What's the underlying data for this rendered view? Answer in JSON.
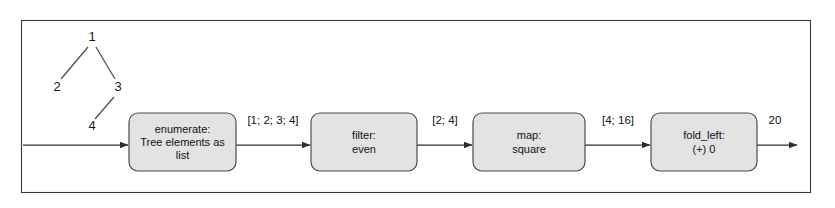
{
  "diagram": {
    "frame": {
      "border_color": "#3a3a3a",
      "background": "#ffffff"
    },
    "box_style": {
      "fill": "#e3e3e3",
      "stroke": "#4d4d4d"
    },
    "tree": {
      "nodes": [
        {
          "id": "n1",
          "label": "1",
          "x": 92,
          "y": 38
        },
        {
          "id": "n2",
          "label": "2",
          "x": 57,
          "y": 88
        },
        {
          "id": "n3",
          "label": "3",
          "x": 118,
          "y": 88
        },
        {
          "id": "n4",
          "label": "4",
          "x": 92,
          "y": 127
        }
      ],
      "edges": [
        {
          "from": "n1",
          "to": "n2"
        },
        {
          "from": "n1",
          "to": "n3"
        },
        {
          "from": "n3",
          "to": "n4"
        }
      ]
    },
    "stages": [
      {
        "id": "enumerate",
        "lines": [
          "enumerate:",
          "Tree elements as",
          "list"
        ],
        "x": 129,
        "y": 113,
        "width": 107,
        "height": 58
      },
      {
        "id": "filter",
        "lines": [
          "filter:",
          "even"
        ],
        "x": 311,
        "y": 113,
        "width": 106,
        "height": 58
      },
      {
        "id": "map",
        "lines": [
          "map:",
          "square"
        ],
        "x": 473,
        "y": 113,
        "width": 112,
        "height": 58
      },
      {
        "id": "fold_left",
        "lines": [
          "fold_left:",
          "(+) 0"
        ],
        "x": 651,
        "y": 113,
        "width": 106,
        "height": 58
      }
    ],
    "flow_labels": [
      {
        "id": "label-input-list",
        "text": "[1; 2; 3; 4]",
        "x": 273,
        "y": 124
      },
      {
        "id": "label-filtered-list",
        "text": "[2; 4]",
        "x": 445,
        "y": 124
      },
      {
        "id": "label-squared-list",
        "text": "[4; 16]",
        "x": 618,
        "y": 124
      },
      {
        "id": "label-result",
        "text": "20",
        "x": 775,
        "y": 124
      }
    ]
  }
}
